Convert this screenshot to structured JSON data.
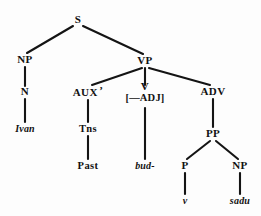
{
  "figure": {
    "type": "syntax-tree-diagram",
    "background_color": "#fdfdfd",
    "line_color": "#141414",
    "text_color": "#111111"
  },
  "nodes": {
    "s": {
      "label": "S",
      "x": 78,
      "y": 20
    },
    "np_subject": {
      "label": "NP",
      "x": 25,
      "y": 60
    },
    "n": {
      "label": "N",
      "x": 25,
      "y": 92
    },
    "ivan": {
      "label": "Ivan",
      "x": 25,
      "y": 129
    },
    "vp": {
      "label": "VP",
      "x": 145,
      "y": 61
    },
    "aux": {
      "label": "AUX",
      "prime": "’",
      "x": 88,
      "y": 92
    },
    "tns": {
      "label": "Tns",
      "x": 88,
      "y": 129
    },
    "past": {
      "label": "Past",
      "x": 88,
      "y": 166
    },
    "v": {
      "label": "V",
      "feature": "[—ADJ]",
      "x": 145,
      "y": 92
    },
    "bud": {
      "label": "bud-",
      "x": 145,
      "y": 166
    },
    "adv": {
      "label": "ADV",
      "x": 213,
      "y": 92
    },
    "pp": {
      "label": "PP",
      "x": 213,
      "y": 134
    },
    "p": {
      "label": "P",
      "x": 185,
      "y": 166
    },
    "np_object": {
      "label": "NP",
      "x": 240,
      "y": 166
    },
    "v_terminal": {
      "label": "v",
      "x": 185,
      "y": 201
    },
    "sadu": {
      "label": "sadu",
      "x": 240,
      "y": 201
    }
  },
  "edges": [
    {
      "from": "s",
      "to": "np_subject",
      "x1": 73,
      "y1": 26,
      "x2": 27,
      "y2": 53
    },
    {
      "from": "s",
      "to": "vp",
      "x1": 83,
      "y1": 26,
      "x2": 143,
      "y2": 54
    },
    {
      "from": "np_subject",
      "to": "n",
      "x1": 25,
      "y1": 67,
      "x2": 25,
      "y2": 86
    },
    {
      "from": "n",
      "to": "ivan",
      "x1": 25,
      "y1": 99,
      "x2": 25,
      "y2": 122
    },
    {
      "from": "vp",
      "to": "aux",
      "x1": 142,
      "y1": 68,
      "x2": 92,
      "y2": 85
    },
    {
      "from": "vp",
      "to": "v",
      "x1": 145,
      "y1": 68,
      "x2": 145,
      "y2": 85
    },
    {
      "from": "vp",
      "to": "adv",
      "x1": 149,
      "y1": 68,
      "x2": 210,
      "y2": 85
    },
    {
      "from": "aux",
      "to": "tns",
      "x1": 88,
      "y1": 100,
      "x2": 88,
      "y2": 122
    },
    {
      "from": "tns",
      "to": "past",
      "x1": 88,
      "y1": 136,
      "x2": 88,
      "y2": 159
    },
    {
      "from": "v",
      "to": "bud",
      "x1": 145,
      "y1": 108,
      "x2": 145,
      "y2": 159
    },
    {
      "from": "adv",
      "to": "pp",
      "x1": 213,
      "y1": 99,
      "x2": 213,
      "y2": 127
    },
    {
      "from": "pp",
      "to": "p",
      "x1": 210,
      "y1": 141,
      "x2": 187,
      "y2": 159
    },
    {
      "from": "pp",
      "to": "np_object",
      "x1": 216,
      "y1": 141,
      "x2": 238,
      "y2": 159
    },
    {
      "from": "p",
      "to": "v_terminal",
      "x1": 185,
      "y1": 173,
      "x2": 185,
      "y2": 194
    },
    {
      "from": "np_object",
      "to": "sadu",
      "x1": 240,
      "y1": 173,
      "x2": 240,
      "y2": 194
    }
  ]
}
